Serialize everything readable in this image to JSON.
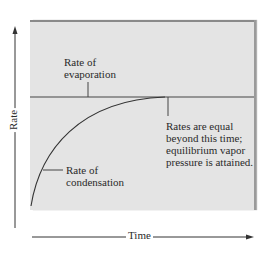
{
  "diagram": {
    "colors": {
      "panel_bg": "#e4e4e4",
      "line": "#333333",
      "border": "#8a8a8a"
    },
    "axes": {
      "x_label": "Time",
      "y_label": "Rate"
    },
    "labels": {
      "evaporation_line1": "Rate of",
      "evaporation_line2": "evaporation",
      "condensation_line1": "Rate of",
      "condensation_line2": "condensation",
      "equilibrium_line1": "Rates are equal",
      "equilibrium_line2": "beyond this time;",
      "equilibrium_line3": "equilibrium vapor",
      "equilibrium_line4": "pressure is attained."
    }
  }
}
